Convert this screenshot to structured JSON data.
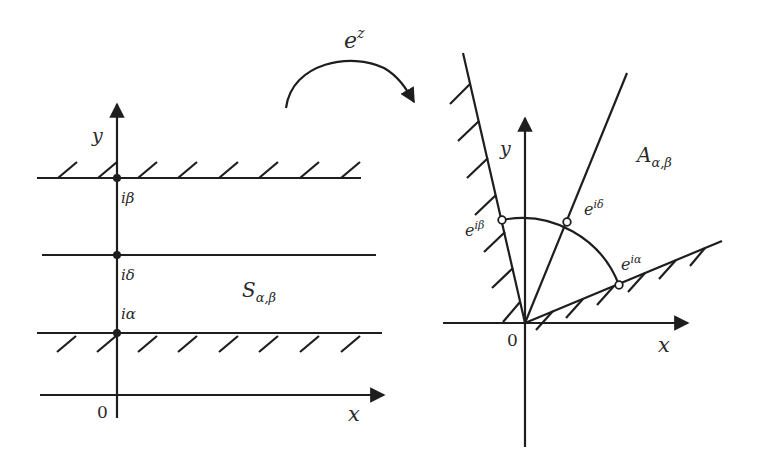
{
  "figure": {
    "mapping_label": "e",
    "mapping_exponent": "z",
    "colors": {
      "stroke": "#1e1e1e",
      "text": "#2a2a2a",
      "background": "#ffffff"
    }
  },
  "strip": {
    "region_label": "S",
    "region_subscript": "α,β",
    "axis_x": "x",
    "axis_y": "y",
    "origin": "0",
    "points": [
      {
        "label": "iβ",
        "role": "upper boundary (hatched)"
      },
      {
        "label": "iδ",
        "role": "interior line"
      },
      {
        "label": "iα",
        "role": "lower boundary (hatched)"
      }
    ]
  },
  "angle": {
    "region_label": "A",
    "region_subscript": "α,β",
    "axis_x": "x",
    "axis_y": "y",
    "origin": "0",
    "points": [
      {
        "base": "e",
        "sup": "iβ",
        "role": "boundary ray (hatched)"
      },
      {
        "base": "e",
        "sup": "iδ",
        "role": "interior ray"
      },
      {
        "base": "e",
        "sup": "iα",
        "role": "boundary ray (hatched)"
      }
    ]
  }
}
